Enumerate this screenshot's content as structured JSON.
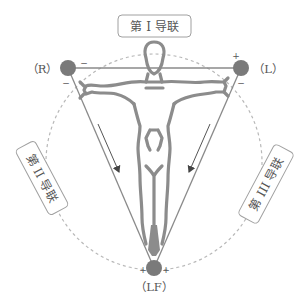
{
  "diagram": {
    "type": "einthoven-triangle",
    "leads": {
      "lead_1": {
        "label": "第 I 导联"
      },
      "lead_2": {
        "label": "第 II 导联"
      },
      "lead_3": {
        "label": "第 III 导联"
      }
    },
    "electrodes": {
      "right_arm": {
        "label": "（R）",
        "polarity_marks": [
          "−",
          "−"
        ]
      },
      "left_arm": {
        "label": "（L）",
        "polarity_marks": [
          "+",
          "−"
        ]
      },
      "left_foot": {
        "label": "（LF）",
        "polarity_marks": [
          "+",
          "+"
        ]
      }
    },
    "colors": {
      "electrode": "#7a7a7a",
      "triangle_line": "#8a8a8a",
      "figure": "#8c8c8c",
      "dashed_circle": "#b5b5b5",
      "arrow": "#555555",
      "label_border": "#999999",
      "text": "#555555"
    }
  }
}
